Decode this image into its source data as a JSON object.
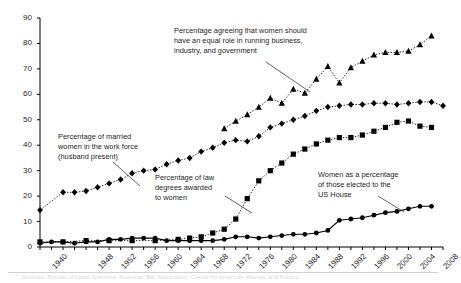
{
  "figure": {
    "ylabel": "Percentage",
    "bottom_caption": "Sources: Bureau of Labor Statistics; American Bar Association; Center for American Women and Politics"
  },
  "annotations": [
    {
      "name": "annotation-equal-role",
      "text": "Percentage agreeing that women should\nhave an equal role in running business,\nindustry, and government"
    },
    {
      "name": "annotation-married-women",
      "text": "Percentage of married\nwomen in the work force\n(husband present)"
    },
    {
      "name": "annotation-law-degrees",
      "text": "Percentage of law\ndegrees awarded\nto women"
    },
    {
      "name": "annotation-us-house",
      "text": "Women as a percentage\nof those elected to the\nUS House"
    }
  ],
  "chart_data": {
    "type": "line",
    "title": "",
    "xlabel": "",
    "ylabel": "Percentage",
    "ylim": [
      0,
      90
    ],
    "ytick_step": 10,
    "yticks": [
      0,
      10,
      20,
      30,
      40,
      50,
      60,
      70,
      80,
      90
    ],
    "xlim": [
      1940,
      2010
    ],
    "xtick_step_minor": 2,
    "xticks": [
      1940,
      1948,
      1952,
      1956,
      1960,
      1964,
      1968,
      1972,
      1976,
      1980,
      1984,
      1988,
      1992,
      1996,
      2000,
      2004,
      2008
    ],
    "grid": false,
    "legend_position": "none (inline annotations)",
    "series": [
      {
        "name": "Percentage agreeing that women should have an equal role in running business, industry, and government",
        "marker": "triangle",
        "linestyle": "dotted",
        "x": [
          1972,
          1974,
          1976,
          1978,
          1980,
          1982,
          1984,
          1986,
          1988,
          1990,
          1992,
          1994,
          1996,
          1998,
          2000,
          2002,
          2004,
          2006,
          2008
        ],
        "y": [
          46.5,
          49.5,
          52.0,
          55.0,
          58.5,
          56.5,
          62.0,
          60.5,
          66.0,
          71.0,
          64.5,
          70.5,
          73.0,
          75.5,
          76.5,
          76.5,
          77.0,
          79.5,
          83.0
        ]
      },
      {
        "name": "Percentage of married women in the work force (husband present)",
        "marker": "diamond",
        "linestyle": "dotted",
        "x": [
          1940,
          1944,
          1946,
          1948,
          1950,
          1952,
          1954,
          1956,
          1958,
          1960,
          1962,
          1964,
          1966,
          1968,
          1970,
          1972,
          1974,
          1976,
          1978,
          1980,
          1982,
          1984,
          1986,
          1988,
          1990,
          1992,
          1994,
          1996,
          1998,
          2000,
          2002,
          2004,
          2006,
          2008,
          2010
        ],
        "y": [
          14.5,
          21.5,
          21.5,
          22.0,
          23.5,
          25.0,
          26.5,
          29.0,
          30.0,
          30.5,
          32.5,
          34.0,
          35.0,
          37.5,
          39.0,
          41.0,
          42.0,
          41.5,
          43.5,
          47.0,
          48.5,
          50.0,
          51.5,
          53.5,
          55.0,
          55.5,
          56.0,
          56.0,
          56.5,
          56.5,
          56.0,
          56.5,
          57.0,
          57.0,
          55.5
        ]
      },
      {
        "name": "Percentage of law degrees awarded to women",
        "marker": "square",
        "linestyle": "dotted",
        "x": [
          1940,
          1944,
          1948,
          1952,
          1956,
          1960,
          1964,
          1966,
          1968,
          1970,
          1972,
          1974,
          1976,
          1978,
          1980,
          1982,
          1984,
          1986,
          1988,
          1990,
          1992,
          1994,
          1996,
          1998,
          2000,
          2002,
          2004,
          2006,
          2008
        ],
        "y": [
          2.0,
          2.0,
          2.5,
          2.5,
          2.5,
          2.5,
          3.0,
          3.5,
          4.0,
          5.5,
          7.0,
          11.0,
          19.0,
          26.0,
          30.0,
          33.0,
          36.5,
          38.5,
          40.5,
          42.0,
          43.0,
          43.0,
          44.0,
          45.5,
          47.0,
          49.0,
          49.5,
          47.5,
          47.0
        ]
      },
      {
        "name": "Women as a percentage of those elected to the US House",
        "marker": "circle",
        "linestyle": "solid",
        "x": [
          1940,
          1942,
          1944,
          1946,
          1948,
          1950,
          1952,
          1954,
          1956,
          1958,
          1960,
          1962,
          1964,
          1966,
          1968,
          1970,
          1972,
          1974,
          1976,
          1978,
          1980,
          1982,
          1984,
          1986,
          1988,
          1990,
          1992,
          1994,
          1996,
          1998,
          2000,
          2002,
          2004,
          2006,
          2008
        ],
        "y": [
          1.5,
          2.0,
          2.0,
          1.5,
          2.0,
          2.0,
          3.0,
          3.0,
          3.5,
          3.5,
          3.5,
          2.5,
          2.5,
          2.5,
          2.5,
          2.5,
          3.0,
          4.0,
          4.0,
          3.5,
          4.0,
          4.5,
          5.0,
          5.0,
          5.5,
          6.5,
          10.5,
          11.0,
          11.5,
          12.5,
          13.5,
          14.0,
          15.0,
          16.0,
          16.0
        ]
      }
    ]
  }
}
